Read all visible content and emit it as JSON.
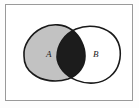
{
  "figure": {
    "kind": "venn-diagram",
    "caption": "",
    "frame": {
      "border_color": "#9a9a9a",
      "background_color": "#ffffff",
      "margin_color": "#fdfdfd"
    }
  },
  "sets": [
    {
      "id": "A",
      "label": "A",
      "fill_color": "#c2c2c2",
      "stroke_color": "#1a1a1a",
      "position": "left",
      "label_x": 49,
      "label_y": 55
    },
    {
      "id": "B",
      "label": "B",
      "fill_color": "#ffffff",
      "stroke_color": "#1a1a1a",
      "position": "right",
      "label_x": 96,
      "label_y": 55
    }
  ],
  "regions": [
    {
      "id": "a-only",
      "name": "A minus B",
      "shaded": false,
      "fill_color": "#c2c2c2"
    },
    {
      "id": "intersection",
      "name": "A intersect B",
      "shaded": true,
      "fill_color": "#1c1c1c"
    },
    {
      "id": "b-only",
      "name": "B minus A",
      "shaded": false,
      "fill_color": "#ffffff"
    }
  ],
  "shapes": {
    "blob_a_path": "M 24 56 C 23 46, 30 34, 42 28 C 52 23, 64 24, 72 30 C 80 36, 85 46, 85 56 C 85 66, 79 75, 68 79 C 56 83, 42 81, 33 74 C 26 69, 24 62, 24 56 Z",
    "blob_b_path": "M 57 57 C 57 45, 64 34, 76 29 C 88 24, 102 26, 111 33 C 120 40, 122 52, 119 63 C 116 74, 106 82, 94 83 C 82 84, 70 79, 63 71 C 59 66, 57 61, 57 57 Z"
  }
}
